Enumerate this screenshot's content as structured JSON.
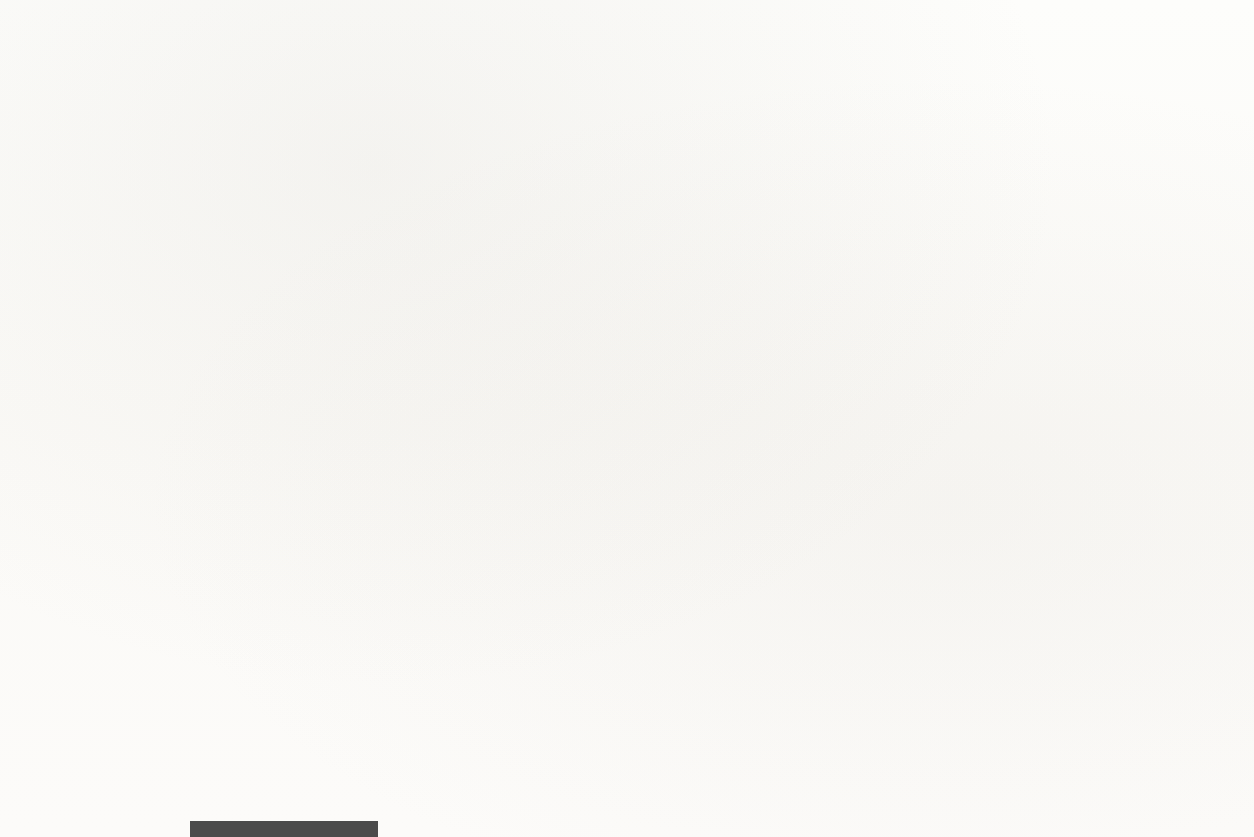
{
  "chart_data": {
    "type": "line",
    "title": "",
    "xlabel": "Ano",
    "ylabel": "Taxa de crescimento (porcentagem anual)",
    "xlim": [
      1950,
      2010
    ],
    "ylim": [
      -10,
      22
    ],
    "yticks": [
      -10,
      -5,
      0,
      5,
      10,
      15,
      20
    ],
    "ytick_labels": [
      "-10",
      "-5",
      "0",
      "5",
      "10",
      "15",
      "20"
    ],
    "xticks": [
      1950,
      1955,
      1960,
      1965,
      1970,
      1975,
      1980,
      1985,
      1990,
      1995,
      2000,
      2005,
      2010
    ],
    "xtick_labels": [
      "1950",
      "1955",
      "1960",
      "1965",
      "1970",
      "1975",
      "1980",
      "1985",
      "1990",
      "1995",
      "2000",
      "2005",
      "2010"
    ],
    "minor_xtick_step": 1,
    "grid": false,
    "legend_position": "inline-annotations",
    "zero_line": 0,
    "line_color": "#4a4a4a",
    "line_width": 4,
    "x": [
      1950,
      1951,
      1952,
      1953,
      1954,
      1955,
      1956,
      1957,
      1958,
      1959,
      1960,
      1961,
      1962,
      1963,
      1964,
      1965,
      1966,
      1967,
      1968,
      1969,
      1970,
      1971,
      1972,
      1973,
      1974,
      1975,
      1976,
      1977,
      1978,
      1979,
      1980,
      1981,
      1982,
      1983,
      1984,
      1985,
      1986,
      1987,
      1988,
      1989,
      1990,
      1991,
      1992,
      1993,
      1994,
      1995,
      1996,
      1997,
      1998,
      1999,
      2000,
      2001,
      2002,
      2003,
      2004,
      2005,
      2006,
      2007,
      2008,
      2009,
      2010
    ],
    "series": [
      {
        "name": "Duráveis",
        "label": "Duráveis",
        "values": [
          21.8,
          -8.4,
          -0.9,
          11.7,
          -0.6,
          21.4,
          -3.7,
          -1.1,
          -7.7,
          11.8,
          2.0,
          -2.8,
          11.3,
          9.2,
          10.6,
          12.4,
          6.5,
          1.4,
          11.0,
          3.6,
          -2.8,
          10.1,
          12.3,
          9.7,
          -6.6,
          1.3,
          12.4,
          9.6,
          5.0,
          -1.5,
          -8.2,
          1.3,
          0.4,
          14.1,
          14.1,
          10.3,
          9.3,
          2.3,
          5.6,
          1.3,
          -1.1,
          -5.7,
          5.9,
          7.8,
          7.9,
          3.7,
          6.1,
          8.4,
          11.2,
          12.8,
          7.4,
          5.1,
          7.3,
          5.9,
          6.3,
          4.6,
          3.6,
          3.7,
          -5.6,
          -4.1,
          7.4
        ]
      },
      {
        "name": "PNB",
        "label": "PNB",
        "values": [
          8.7,
          8.0,
          4.1,
          4.7,
          -0.6,
          7.1,
          2.1,
          2.1,
          -0.7,
          6.9,
          2.6,
          2.6,
          6.1,
          4.4,
          5.8,
          6.4,
          6.5,
          2.5,
          4.8,
          3.1,
          0.2,
          3.3,
          5.3,
          5.8,
          -0.5,
          -0.2,
          5.4,
          4.6,
          5.6,
          3.2,
          -0.2,
          2.6,
          -1.9,
          4.6,
          7.3,
          4.2,
          3.5,
          3.5,
          4.2,
          3.7,
          1.9,
          -0.2,
          3.4,
          2.9,
          4.1,
          2.5,
          3.8,
          4.5,
          4.5,
          4.8,
          4.1,
          1.0,
          1.8,
          2.8,
          3.8,
          3.3,
          2.7,
          1.8,
          -0.3,
          -3.5,
          3.0
        ]
      },
      {
        "name": "Não duráveis",
        "label": "Não duráveis",
        "values": [
          3.1,
          1.7,
          2.3,
          3.1,
          1.2,
          5.1,
          2.7,
          1.8,
          1.4,
          4.2,
          2.3,
          1.8,
          3.0,
          2.5,
          3.5,
          5.5,
          5.6,
          2.8,
          4.4,
          2.9,
          2.1,
          2.0,
          4.4,
          3.1,
          -0.6,
          1.0,
          3.5,
          3.5,
          3.0,
          1.6,
          0.7,
          1.7,
          1.3,
          4.0,
          3.5,
          3.2,
          3.5,
          2.3,
          3.5,
          2.6,
          2.0,
          -0.5,
          2.5,
          2.9,
          3.1,
          2.5,
          3.0,
          2.7,
          3.9,
          4.8,
          3.9,
          2.2,
          2.5,
          2.8,
          3.0,
          3.3,
          2.9,
          2.1,
          -1.2,
          -1.5,
          2.5
        ]
      }
    ],
    "annotations": [
      {
        "name": "duraveis",
        "text": "Duráveis",
        "text_x": 330,
        "text_y": 155,
        "arrow_from_x": 318,
        "arrow_from_y": 168,
        "arrow_to_x": 229,
        "arrow_to_y": 218
      },
      {
        "name": "pnb",
        "text": "PNB",
        "text_x": 893,
        "text_y": 246,
        "arrow_from_x": 885,
        "arrow_from_y": 258,
        "arrow_to_x": 740,
        "arrow_to_y": 377
      },
      {
        "name": "nao-duraveis",
        "text": "Não duráveis",
        "text_x": 330,
        "text_y": 600,
        "arrow_from_x": 382,
        "arrow_from_y": 580,
        "arrow_to_x": 351,
        "arrow_to_y": 466
      }
    ]
  },
  "figure": {
    "plot_left": 113,
    "plot_right": 1205,
    "plot_top": 30,
    "plot_bottom": 708,
    "y_zero_px": 508,
    "px_per_unit": 21.0
  }
}
